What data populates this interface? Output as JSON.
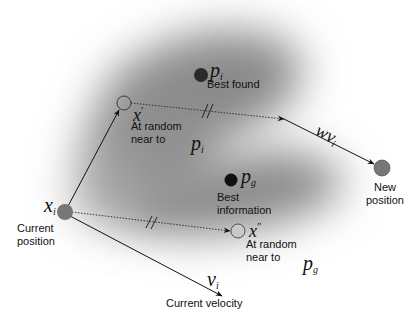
{
  "diagram": {
    "nodes": {
      "current_position": {
        "symbol": "x",
        "sub": "i",
        "label": "Current position",
        "line1": "Current",
        "line2": "position",
        "color": "#777777"
      },
      "x_prime": {
        "symbol": "x",
        "sup": "′",
        "label": "At random near to",
        "line1": "At random",
        "line2": "near to",
        "ref_symbol": "p",
        "ref_sub": "i"
      },
      "best_found": {
        "symbol": "p",
        "sub": "i",
        "label": "Best found",
        "color": "#2a2a2a"
      },
      "best_information": {
        "symbol": "p",
        "sub": "g",
        "line1": "Best",
        "line2": "information",
        "color": "#111111"
      },
      "x_double_prime": {
        "symbol": "x",
        "sup": "″",
        "line1": "At random",
        "line2": "near to",
        "ref_symbol": "p",
        "ref_sub": "g",
        "color": "#c8c8c8"
      },
      "new_position": {
        "symbol": "",
        "line1": "New",
        "line2": "position",
        "color": "#777777"
      }
    },
    "edges": {
      "velocity": {
        "symbol": "v",
        "sub": "i",
        "label": "Current velocity"
      },
      "inertia": {
        "symbol": "wv",
        "sub": "i"
      },
      "to_x_prime": {
        "style": "solid"
      },
      "dotted_to_new": {
        "style": "dotted",
        "marker": "//"
      },
      "dotted_to_x2": {
        "style": "dotted",
        "marker": "//"
      }
    }
  }
}
